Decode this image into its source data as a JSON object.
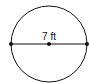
{
  "diagram": {
    "shape": "circle",
    "segment": "diameter",
    "label": "7 ft",
    "colors": {
      "stroke": "#111111",
      "background": "#ffffff"
    },
    "points": [
      "left-endpoint",
      "center",
      "right-endpoint"
    ]
  }
}
